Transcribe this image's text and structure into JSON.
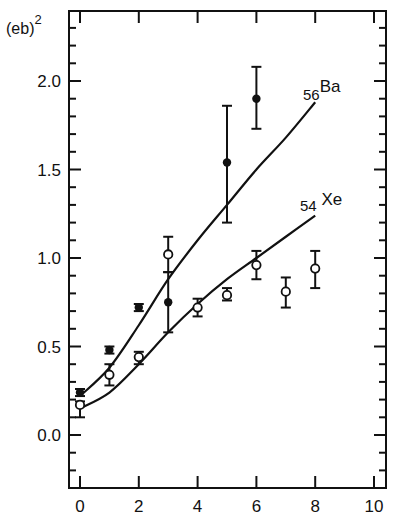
{
  "chart_data": {
    "type": "scatter",
    "title": "",
    "ylabel": "(eb)",
    "ylabel_superscript": "2",
    "xlabel": "",
    "xlim": [
      -0.6,
      10.2
    ],
    "ylim": [
      -0.3,
      2.4
    ],
    "xticks": [
      0,
      2,
      4,
      6,
      8,
      10
    ],
    "xtick_labels": [
      "0",
      "2",
      "4",
      "6",
      "8",
      "10"
    ],
    "yticks": [
      0.0,
      0.5,
      1.0,
      1.5,
      2.0
    ],
    "ytick_labels": [
      "0.0",
      "0.5",
      "1.0",
      "1.5",
      "2.0"
    ],
    "y_minor_step": 0.1,
    "grid": false,
    "legend": "inline labels at curve ends",
    "series": [
      {
        "name": "Ba",
        "label_prefix": "56",
        "label_main": "Ba",
        "marker": "filled-circle",
        "points": [
          {
            "x": 0,
            "y": 0.24,
            "yerr_low": 0.22,
            "yerr_high": 0.26
          },
          {
            "x": 1,
            "y": 0.48,
            "yerr_low": 0.46,
            "yerr_high": 0.5
          },
          {
            "x": 2,
            "y": 0.72,
            "yerr_low": 0.7,
            "yerr_high": 0.74
          },
          {
            "x": 3,
            "y": 0.75,
            "yerr_low": 0.58,
            "yerr_high": 0.92
          },
          {
            "x": 5,
            "y": 1.54,
            "yerr_low": 1.2,
            "yerr_high": 1.86
          },
          {
            "x": 6,
            "y": 1.9,
            "yerr_low": 1.73,
            "yerr_high": 2.08
          }
        ],
        "curve": {
          "x": [
            0,
            1,
            2,
            3,
            4,
            5,
            6,
            7,
            8
          ],
          "y": [
            0.22,
            0.38,
            0.62,
            0.88,
            1.1,
            1.3,
            1.5,
            1.68,
            1.88
          ]
        }
      },
      {
        "name": "Xe",
        "label_prefix": "54",
        "label_main": "Xe",
        "marker": "open-circle",
        "points": [
          {
            "x": 0,
            "y": 0.17,
            "yerr_low": 0.1,
            "yerr_high": 0.19
          },
          {
            "x": 1,
            "y": 0.34,
            "yerr_low": 0.28,
            "yerr_high": 0.4
          },
          {
            "x": 2,
            "y": 0.44,
            "yerr_low": 0.4,
            "yerr_high": 0.47
          },
          {
            "x": 3,
            "y": 1.02,
            "yerr_low": 0.92,
            "yerr_high": 1.12
          },
          {
            "x": 4,
            "y": 0.72,
            "yerr_low": 0.67,
            "yerr_high": 0.77
          },
          {
            "x": 5,
            "y": 0.79,
            "yerr_low": 0.76,
            "yerr_high": 0.83
          },
          {
            "x": 6,
            "y": 0.96,
            "yerr_low": 0.88,
            "yerr_high": 1.04
          },
          {
            "x": 7,
            "y": 0.81,
            "yerr_low": 0.72,
            "yerr_high": 0.89
          },
          {
            "x": 8,
            "y": 0.94,
            "yerr_low": 0.83,
            "yerr_high": 1.04
          }
        ],
        "curve": {
          "x": [
            0,
            1,
            2,
            3,
            4,
            5,
            6,
            7,
            8
          ],
          "y": [
            0.15,
            0.24,
            0.4,
            0.58,
            0.74,
            0.88,
            1.0,
            1.12,
            1.24
          ]
        }
      }
    ]
  },
  "colors": {
    "ink": "#111111",
    "background": "#ffffff"
  }
}
